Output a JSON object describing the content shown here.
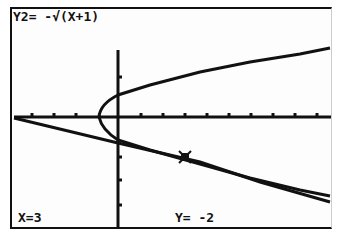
{
  "calculator": {
    "function_label": "Y2= -√(X+1)",
    "trace_x": "X=3",
    "trace_y": "Y= -2"
  },
  "graph": {
    "axis_color": "#111111",
    "curve_color": "#111111",
    "x_ticks": 10,
    "cursor_point": {
      "x": 3,
      "y": -2
    }
  }
}
